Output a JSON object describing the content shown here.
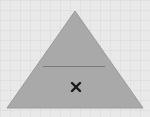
{
  "canvas": {
    "background": "#e9e9e9",
    "grid_size": 10
  },
  "shape": {
    "type": "triangle",
    "fill": "#a9a9a9",
    "stroke": "#9a9a9a",
    "apex": [
      75,
      11
    ],
    "base_left": [
      7,
      108
    ],
    "base_right": [
      143,
      108
    ],
    "divider": {
      "y": 66.5,
      "x1": 43,
      "x2": 105,
      "color": "#7a7a7a"
    },
    "marker": {
      "icon": "x-mark",
      "x": 76,
      "y": 87,
      "color": "#1a1a1a"
    }
  }
}
